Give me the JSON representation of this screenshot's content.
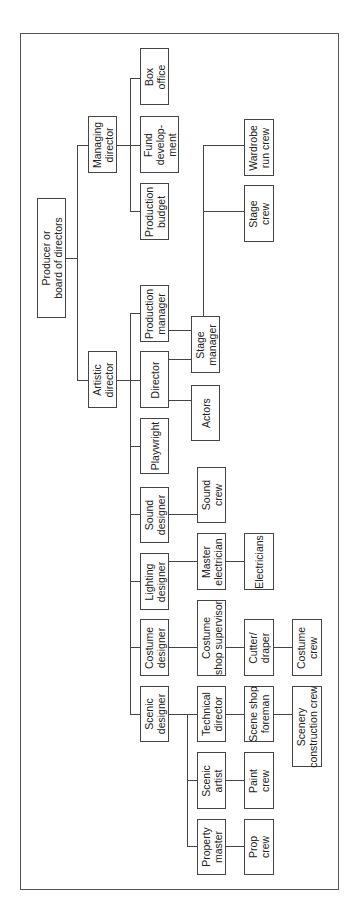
{
  "diagram": {
    "type": "org-chart",
    "orientation": "rotated-90-ccw",
    "colors": {
      "line": "#444444",
      "text": "#222222",
      "background": "#ffffff"
    },
    "frame": {
      "x": 20,
      "y": 33,
      "w": 319,
      "h": 857
    },
    "nodes": [
      {
        "id": "producer",
        "label": "Producer or\nboard of directors",
        "x": 37,
        "y": 198,
        "w": 29,
        "h": 120
      },
      {
        "id": "managing-director",
        "label": "Managing\ndirector",
        "x": 88,
        "y": 116,
        "w": 29,
        "h": 57
      },
      {
        "id": "artistic-director",
        "label": "Artistic\ndirector",
        "x": 88,
        "y": 351,
        "w": 29,
        "h": 57
      },
      {
        "id": "box-office",
        "label": "Box\noffice",
        "x": 140,
        "y": 48,
        "w": 29,
        "h": 57
      },
      {
        "id": "fund-development",
        "label": "Fund\ndevelop-\nment",
        "x": 140,
        "y": 116,
        "w": 39,
        "h": 57
      },
      {
        "id": "production-budget",
        "label": "Production\nbudget",
        "x": 140,
        "y": 183,
        "w": 29,
        "h": 57
      },
      {
        "id": "production-manager",
        "label": "Production\nmanager",
        "x": 140,
        "y": 285,
        "w": 29,
        "h": 57
      },
      {
        "id": "director",
        "label": "Director",
        "x": 140,
        "y": 351,
        "w": 29,
        "h": 57
      },
      {
        "id": "playwright",
        "label": "Playwright",
        "x": 140,
        "y": 418,
        "w": 29,
        "h": 56
      },
      {
        "id": "sound-designer",
        "label": "Sound\ndesigner",
        "x": 140,
        "y": 487,
        "w": 29,
        "h": 56
      },
      {
        "id": "lighting-designer",
        "label": "Lighting\ndesigner",
        "x": 140,
        "y": 553,
        "w": 29,
        "h": 57
      },
      {
        "id": "costume-designer",
        "label": "Costume\ndesigner",
        "x": 140,
        "y": 619,
        "w": 29,
        "h": 57
      },
      {
        "id": "scenic-designer",
        "label": "Scenic\ndesigner",
        "x": 140,
        "y": 686,
        "w": 29,
        "h": 56
      },
      {
        "id": "stage-manager",
        "label": "Stage\nmanager",
        "x": 191,
        "y": 316,
        "w": 29,
        "h": 57
      },
      {
        "id": "actors",
        "label": "Actors",
        "x": 191,
        "y": 385,
        "w": 29,
        "h": 56
      },
      {
        "id": "sound-crew",
        "label": "Sound\ncrew",
        "x": 197,
        "y": 467,
        "w": 29,
        "h": 56
      },
      {
        "id": "master-electrician",
        "label": "Master\nelectrician",
        "x": 197,
        "y": 533,
        "w": 29,
        "h": 57
      },
      {
        "id": "costume-shop-supervisor",
        "label": "Costume\nshop supervisor",
        "x": 197,
        "y": 600,
        "w": 29,
        "h": 76
      },
      {
        "id": "technical-director",
        "label": "Technical\ndirector",
        "x": 197,
        "y": 686,
        "w": 29,
        "h": 56
      },
      {
        "id": "scenic-artist",
        "label": "Scenic\nartist",
        "x": 197,
        "y": 752,
        "w": 29,
        "h": 57
      },
      {
        "id": "property-master",
        "label": "Property\nmaster",
        "x": 197,
        "y": 819,
        "w": 29,
        "h": 56
      },
      {
        "id": "wardrobe-run-crew",
        "label": "Wardrobe\nrun crew",
        "x": 244,
        "y": 119,
        "w": 30,
        "h": 57
      },
      {
        "id": "stage-crew",
        "label": "Stage\ncrew",
        "x": 244,
        "y": 185,
        "w": 30,
        "h": 57
      },
      {
        "id": "electricians",
        "label": "Electricians",
        "x": 244,
        "y": 533,
        "w": 30,
        "h": 57
      },
      {
        "id": "cutter-draper",
        "label": "Cutter/\ndraper",
        "x": 244,
        "y": 619,
        "w": 30,
        "h": 57
      },
      {
        "id": "scene-shop-foreman",
        "label": "Scene shop\nforeman",
        "x": 244,
        "y": 686,
        "w": 30,
        "h": 56
      },
      {
        "id": "paint-crew",
        "label": "Paint\ncrew",
        "x": 244,
        "y": 752,
        "w": 30,
        "h": 57
      },
      {
        "id": "prop-crew",
        "label": "Prop\ncrew",
        "x": 244,
        "y": 819,
        "w": 30,
        "h": 56
      },
      {
        "id": "costume-crew",
        "label": "Costume\ncrew",
        "x": 292,
        "y": 619,
        "w": 30,
        "h": 57
      },
      {
        "id": "scenery-construction-crew",
        "label": "Scenery\nconstruction crew",
        "x": 292,
        "y": 686,
        "w": 30,
        "h": 81
      }
    ],
    "lines": [
      {
        "x": 65,
        "y": 258,
        "w": 12,
        "h": 1
      },
      {
        "x": 77,
        "y": 145,
        "w": 1,
        "h": 235
      },
      {
        "x": 77,
        "y": 145,
        "w": 11,
        "h": 1
      },
      {
        "x": 77,
        "y": 380,
        "w": 11,
        "h": 1
      },
      {
        "x": 117,
        "y": 145,
        "w": 23,
        "h": 1
      },
      {
        "x": 130,
        "y": 78,
        "w": 1,
        "h": 134
      },
      {
        "x": 130,
        "y": 78,
        "w": 10,
        "h": 1
      },
      {
        "x": 130,
        "y": 211,
        "w": 10,
        "h": 1
      },
      {
        "x": 117,
        "y": 380,
        "w": 23,
        "h": 1
      },
      {
        "x": 130,
        "y": 313,
        "w": 1,
        "h": 401
      },
      {
        "x": 130,
        "y": 313,
        "w": 10,
        "h": 1
      },
      {
        "x": 130,
        "y": 446,
        "w": 10,
        "h": 1
      },
      {
        "x": 130,
        "y": 514,
        "w": 10,
        "h": 1
      },
      {
        "x": 130,
        "y": 581,
        "w": 10,
        "h": 1
      },
      {
        "x": 130,
        "y": 647,
        "w": 10,
        "h": 1
      },
      {
        "x": 130,
        "y": 714,
        "w": 10,
        "h": 1
      },
      {
        "x": 169,
        "y": 330,
        "w": 22,
        "h": 1
      },
      {
        "x": 169,
        "y": 359,
        "w": 22,
        "h": 1
      },
      {
        "x": 169,
        "y": 400,
        "w": 22,
        "h": 1
      },
      {
        "x": 203,
        "y": 145,
        "w": 1,
        "h": 171
      },
      {
        "x": 203,
        "y": 145,
        "w": 41,
        "h": 1
      },
      {
        "x": 203,
        "y": 211,
        "w": 41,
        "h": 1
      },
      {
        "x": 169,
        "y": 514,
        "w": 28,
        "h": 1
      },
      {
        "x": 169,
        "y": 561,
        "w": 28,
        "h": 1
      },
      {
        "x": 226,
        "y": 561,
        "w": 18,
        "h": 1
      },
      {
        "x": 169,
        "y": 647,
        "w": 28,
        "h": 1
      },
      {
        "x": 226,
        "y": 647,
        "w": 18,
        "h": 1
      },
      {
        "x": 274,
        "y": 647,
        "w": 18,
        "h": 1
      },
      {
        "x": 169,
        "y": 714,
        "w": 18,
        "h": 1
      },
      {
        "x": 187,
        "y": 714,
        "w": 1,
        "h": 133
      },
      {
        "x": 187,
        "y": 714,
        "w": 10,
        "h": 1
      },
      {
        "x": 187,
        "y": 780,
        "w": 10,
        "h": 1
      },
      {
        "x": 187,
        "y": 846,
        "w": 10,
        "h": 1
      },
      {
        "x": 226,
        "y": 714,
        "w": 18,
        "h": 1
      },
      {
        "x": 274,
        "y": 714,
        "w": 18,
        "h": 1
      },
      {
        "x": 226,
        "y": 780,
        "w": 18,
        "h": 1
      },
      {
        "x": 226,
        "y": 846,
        "w": 18,
        "h": 1
      }
    ]
  }
}
